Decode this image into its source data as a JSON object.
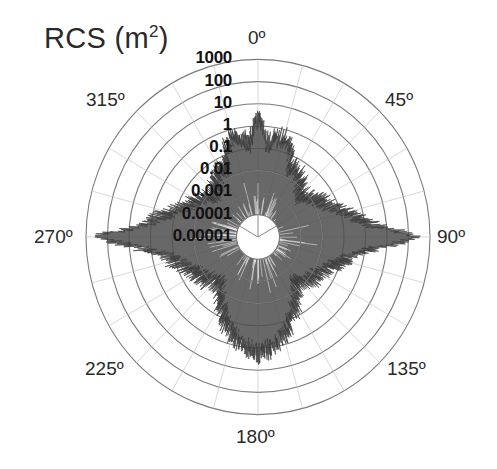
{
  "chart_data": {
    "type": "polar",
    "title": "RCS (m2)",
    "title_main": "RCS (m",
    "title_sup": "2",
    "title_close": ")",
    "radial_scale": "log",
    "radial_tick_labels": [
      "1000",
      "100",
      "10",
      "1",
      "0.1",
      "0.01",
      "0.001",
      "0.0001",
      "0.00001"
    ],
    "radial_range": [
      1e-05,
      1000
    ],
    "angular_tick_labels": [
      "0º",
      "45º",
      "90º",
      "135º",
      "180º",
      "225º",
      "270º",
      "315º"
    ],
    "angular_direction": "clockwise",
    "zero_location": "top",
    "grid": true,
    "series": [
      {
        "name": "RCS",
        "color": "#4a4a4a",
        "angles_deg": [
          0,
          5,
          10,
          15,
          20,
          25,
          30,
          35,
          40,
          45,
          50,
          55,
          60,
          65,
          70,
          75,
          80,
          85,
          90,
          95,
          100,
          105,
          110,
          115,
          120,
          125,
          130,
          135,
          140,
          145,
          150,
          155,
          160,
          165,
          170,
          175,
          180,
          185,
          190,
          195,
          200,
          205,
          210,
          215,
          220,
          225,
          230,
          235,
          240,
          245,
          250,
          255,
          260,
          265,
          270,
          275,
          280,
          285,
          290,
          295,
          300,
          305,
          310,
          315,
          320,
          325,
          330,
          335,
          340,
          345,
          350,
          355
        ],
        "rcs_envelope_m2": [
          5,
          0.3,
          0.5,
          0.6,
          0.3,
          0.05,
          0.05,
          0.03,
          0.02,
          0.01,
          0.01,
          0.02,
          0.03,
          0.05,
          0.1,
          0.3,
          1,
          5,
          500,
          5,
          0.5,
          0.2,
          0.1,
          0.05,
          0.03,
          0.02,
          0.02,
          0.01,
          0.01,
          0.02,
          0.05,
          0.1,
          0.3,
          0.5,
          1,
          2,
          3,
          2,
          1,
          0.5,
          0.3,
          0.1,
          0.05,
          0.02,
          0.01,
          0.01,
          0.02,
          0.02,
          0.03,
          0.05,
          0.1,
          0.2,
          0.5,
          5,
          500,
          5,
          1,
          0.3,
          0.1,
          0.05,
          0.03,
          0.02,
          0.01,
          0.01,
          0.02,
          0.03,
          0.05,
          0.05,
          0.3,
          0.6,
          0.5,
          0.3
        ]
      }
    ]
  },
  "plot": {
    "center_x": 258,
    "center_y": 237,
    "ring_spacing_x": 21.5,
    "ring_spacing_y": 22.2,
    "grid_color": "#7a7a7a",
    "fill_color": "#4d4d4d"
  }
}
